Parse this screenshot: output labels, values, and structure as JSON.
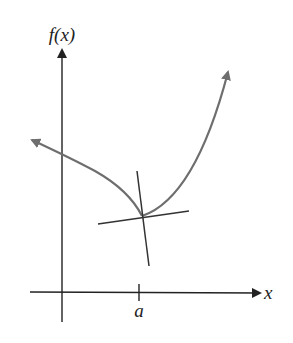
{
  "diagram": {
    "y_axis_label": "f(x)",
    "x_axis_label": "x",
    "x_tick_label": "a",
    "colors": {
      "axes": "#222222",
      "curve": "#6e6e6e",
      "lines": "#333333",
      "background": "#ffffff"
    },
    "elements": [
      "y-axis with arrow",
      "x-axis with arrow",
      "curve f(x) with corner/cusp at x = a",
      "tangent-like line through point (a, f(a))",
      "second line through point (a, f(a))",
      "tick mark at a"
    ]
  }
}
